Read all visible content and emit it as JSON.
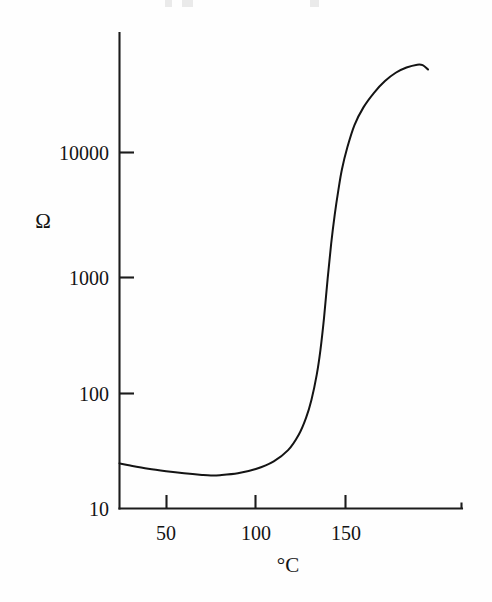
{
  "chart_data": {
    "type": "line",
    "title": "",
    "xlabel": "°C",
    "ylabel": "Ω",
    "xlim": [
      24,
      196
    ],
    "ylim": [
      10,
      100000
    ],
    "yscale": "log",
    "xscale": "linear",
    "grid": false,
    "legend": null,
    "xticks": [
      50,
      100,
      150
    ],
    "xtick_labels": [
      "50",
      "100",
      "150"
    ],
    "yticks": [
      10,
      100,
      1000,
      10000
    ],
    "ytick_labels": [
      "10",
      "100",
      "1000",
      "10000"
    ],
    "series": [
      {
        "name": "resistance",
        "x": [
          24,
          30,
          40,
          50,
          60,
          70,
          75,
          80,
          90,
          100,
          110,
          118,
          124,
          128,
          131,
          134,
          136,
          138,
          140,
          142,
          144,
          146,
          148,
          151,
          155,
          160,
          166,
          172,
          178,
          184,
          190,
          193,
          196
        ],
        "y": [
          24,
          23,
          21.6,
          20.6,
          19.8,
          19.2,
          19.0,
          19.1,
          19.8,
          21.5,
          25,
          31,
          42,
          58,
          82,
          135,
          215,
          400,
          850,
          1700,
          3000,
          4800,
          7200,
          11000,
          17000,
          24000,
          32000,
          40000,
          47000,
          52000,
          55000,
          54500,
          50000
        ]
      }
    ]
  },
  "axis": {
    "y_label_symbol": "Ω",
    "x_label_symbol": "°C",
    "ytick_10000": "10000",
    "ytick_1000": "1000",
    "ytick_100": "100",
    "ytick_10": "10",
    "xtick_50": "50",
    "xtick_100": "100",
    "xtick_150": "150"
  },
  "colors": {
    "background": "#fefefe",
    "ink": "#141414",
    "axis": "#1c1c1c",
    "curve": "#141414"
  }
}
